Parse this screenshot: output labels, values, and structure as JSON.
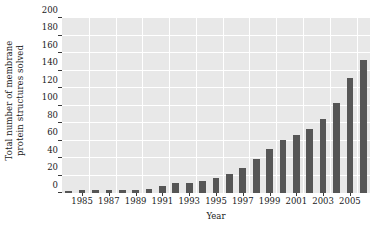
{
  "chart_data": {
    "type": "bar",
    "title": "",
    "subtitle": "",
    "xlabel": "Year",
    "ylabel": "Total number of membrane protein structures solved",
    "ylabel_lines": [
      "Total number of membrane",
      "protein structures solved"
    ],
    "categories": [
      "1984",
      "1985",
      "1986",
      "1987",
      "1988",
      "1989",
      "1990",
      "1991",
      "1992",
      "1993",
      "1994",
      "1995",
      "1996",
      "1997",
      "1998",
      "1999",
      "2000",
      "2001",
      "2002",
      "2003",
      "2004",
      "2005",
      "2006"
    ],
    "values": [
      2,
      3,
      3,
      3,
      3,
      4,
      5,
      8,
      11,
      11,
      14,
      17,
      22,
      29,
      39,
      50,
      61,
      66,
      73,
      85,
      103,
      131,
      152
    ],
    "ylim": [
      0,
      200
    ],
    "ytick_values": [
      0,
      20,
      40,
      60,
      80,
      100,
      120,
      140,
      160,
      180,
      200
    ],
    "ytick_labels": [
      "0",
      "20",
      "40",
      "60",
      "80",
      "100",
      "120",
      "140",
      "160",
      "180",
      "200"
    ],
    "xtick_labels": [
      "1985",
      "1987",
      "1989",
      "1991",
      "1993",
      "1995",
      "1997",
      "1999",
      "2001",
      "2003",
      "2005"
    ],
    "xtick_categories": [
      "1985",
      "1987",
      "1989",
      "1991",
      "1993",
      "1995",
      "1997",
      "1999",
      "2001",
      "2003",
      "2005"
    ],
    "grid": true,
    "grid_color": "#ffffff",
    "panel_color": "#e8e8e8",
    "bar_color": "#565656",
    "legend": null,
    "legend_position": "none"
  }
}
